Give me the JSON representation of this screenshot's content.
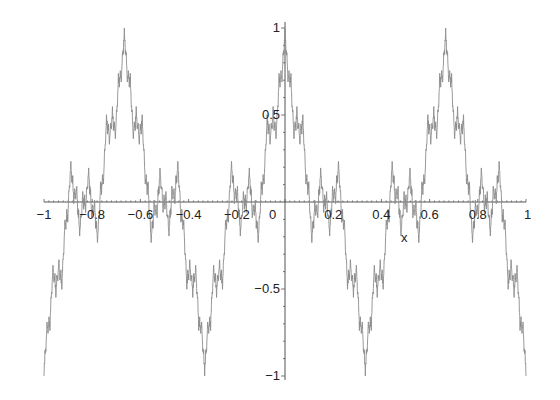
{
  "chart_data": {
    "type": "line",
    "title": "",
    "xlabel": "x",
    "ylabel": "",
    "xlim": [
      -1,
      1
    ],
    "ylim": [
      -1,
      1
    ],
    "grid": false,
    "legend": null,
    "x_ticks": [
      -1,
      -0.8,
      -0.6,
      -0.4,
      -0.2,
      0,
      0.2,
      0.4,
      0.6,
      0.8,
      1
    ],
    "x_tick_labels": [
      "−1",
      "−0.8",
      "−0.6",
      "−0.4",
      "−0.2",
      "0",
      "0.2",
      "0.4",
      "0.6",
      "0.8",
      "1"
    ],
    "y_ticks": [
      1,
      0.5,
      -0.5,
      -1
    ],
    "y_tick_labels": [
      "1",
      "0.5",
      "−0.5",
      "−1"
    ],
    "series": [
      {
        "name": "f(x)",
        "color": "#8c8c8c",
        "description": "Weierstrass-type fractal curve: sum of a^n cos(3^n * pi * x), normalized to peak 1",
        "generator": {
          "a": 0.5,
          "b": 3,
          "terms": 8,
          "n_start": 1,
          "normalize": true
        },
        "key_points": [
          {
            "x": -1,
            "y": -1
          },
          {
            "x": -0.667,
            "y": 1
          },
          {
            "x": -0.333,
            "y": -1
          },
          {
            "x": 0,
            "y": 1
          },
          {
            "x": 0.333,
            "y": -1
          },
          {
            "x": 0.667,
            "y": 1
          },
          {
            "x": 1,
            "y": -1
          }
        ]
      }
    ]
  },
  "layout": {
    "axis_color": "#555555",
    "curve_color": "#8c8c8c"
  }
}
